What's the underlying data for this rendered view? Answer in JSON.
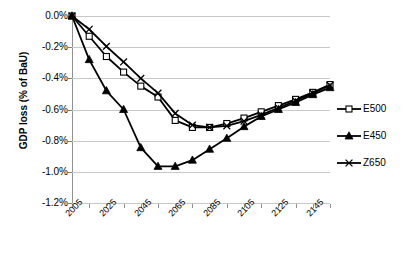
{
  "chart_data": {
    "type": "line",
    "title": "",
    "xlabel": "",
    "ylabel": "GDP loss (% of BaU)",
    "ylim": [
      -1.2,
      0.0
    ],
    "xlim": [
      2005,
      2155
    ],
    "grid": true,
    "legend_position": "right",
    "y_ticks": [
      "0.0%",
      "-0.2%",
      "-0.4%",
      "-0.6%",
      "-0.8%",
      "-1.0%",
      "-1.2%"
    ],
    "y_tick_values": [
      0.0,
      -0.2,
      -0.4,
      -0.6,
      -0.8,
      -1.0,
      -1.2
    ],
    "x_ticks": [
      "2005",
      "2025",
      "2045",
      "2065",
      "2085",
      "2105",
      "2125",
      "2145"
    ],
    "x_tick_values": [
      2005,
      2025,
      2045,
      2065,
      2085,
      2105,
      2125,
      2145
    ],
    "x": [
      2005,
      2015,
      2025,
      2035,
      2045,
      2055,
      2065,
      2075,
      2085,
      2095,
      2105,
      2115,
      2125,
      2135,
      2145,
      2155
    ],
    "series": [
      {
        "name": "E500",
        "marker": "open-square",
        "values": [
          0.0,
          -0.13,
          -0.26,
          -0.36,
          -0.45,
          -0.52,
          -0.67,
          -0.715,
          -0.715,
          -0.69,
          -0.655,
          -0.615,
          -0.575,
          -0.535,
          -0.49,
          -0.44
        ]
      },
      {
        "name": "E450",
        "marker": "filled-triangle",
        "values": [
          0.0,
          -0.28,
          -0.48,
          -0.6,
          -0.845,
          -0.965,
          -0.965,
          -0.925,
          -0.855,
          -0.785,
          -0.71,
          -0.645,
          -0.6,
          -0.555,
          -0.505,
          -0.46
        ]
      },
      {
        "name": "Z650",
        "marker": "x-cross",
        "values": [
          0.0,
          -0.085,
          -0.195,
          -0.295,
          -0.4,
          -0.495,
          -0.625,
          -0.7,
          -0.715,
          -0.705,
          -0.675,
          -0.635,
          -0.59,
          -0.545,
          -0.495,
          -0.445
        ]
      }
    ]
  },
  "legend": {
    "items": [
      {
        "label": "E500",
        "marker": "open-square"
      },
      {
        "label": "E450",
        "marker": "filled-triangle"
      },
      {
        "label": "Z650",
        "marker": "x-cross"
      }
    ]
  },
  "colors": {
    "series_line": "#000000",
    "gridline": "#c8c8c8",
    "axis": "#909090",
    "background": "#ffffff",
    "text": "#000000"
  }
}
